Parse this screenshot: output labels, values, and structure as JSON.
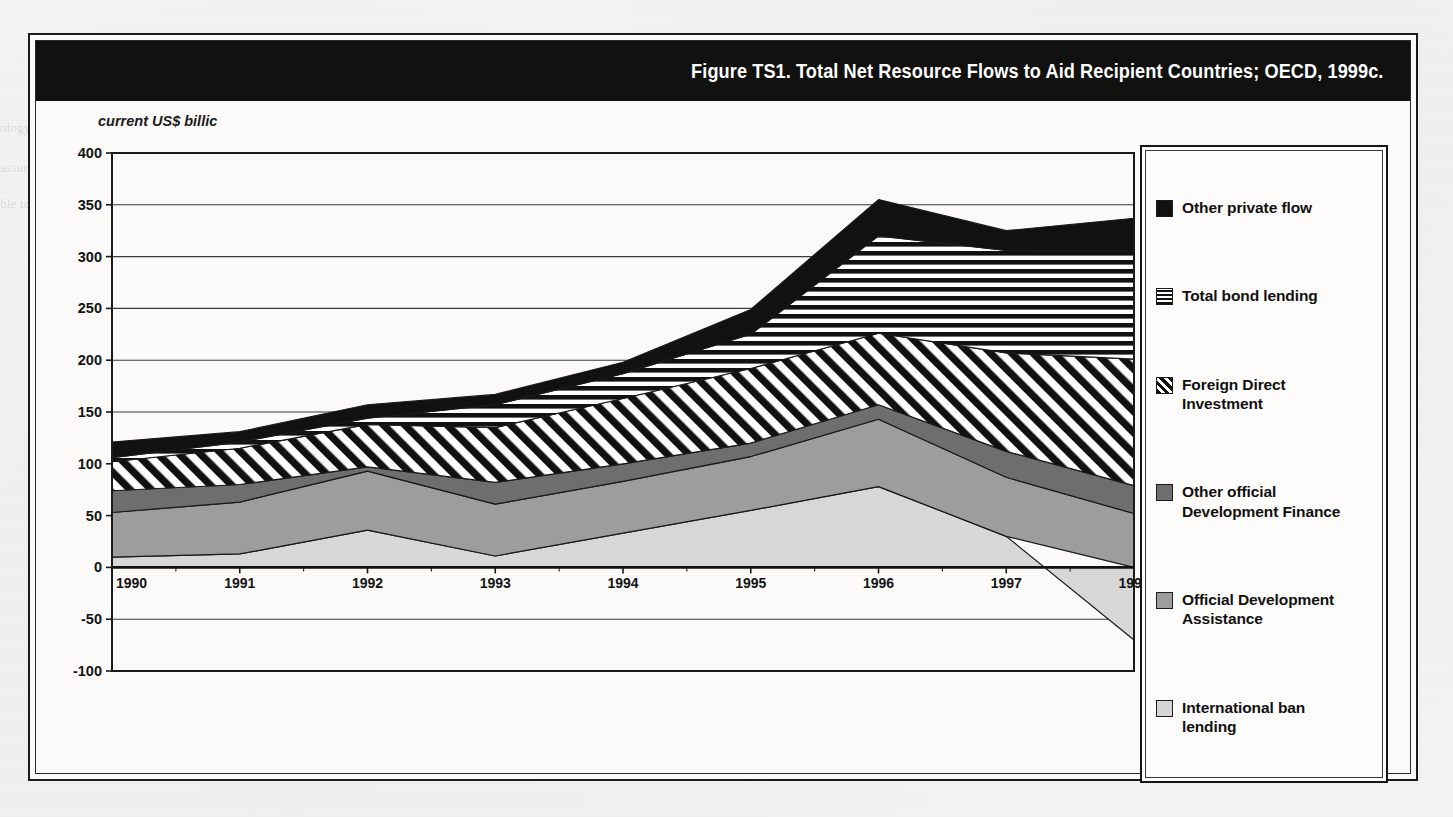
{
  "figure": {
    "title": "Figure TS1. Total Net Resource Flows to Aid Recipient Countries; OECD, 1999c.",
    "axis_caption": "current US$ billic"
  },
  "legend": {
    "position": "right",
    "items": [
      {
        "label": "Other private flow",
        "swatch": "sw-solid-black",
        "icon": "solid-black-swatch-icon"
      },
      {
        "label": "Total bond lending",
        "swatch": "sw-hstripe",
        "icon": "horizontal-stripe-swatch-icon"
      },
      {
        "label": "Foreign Direct Investment",
        "swatch": "sw-dstripe",
        "icon": "diagonal-stripe-swatch-icon"
      },
      {
        "label": "Other official Development Finance",
        "swatch": "sw-darkgray",
        "icon": "dark-gray-swatch-icon"
      },
      {
        "label": "Official Development Assistance",
        "swatch": "sw-midgray",
        "icon": "mid-gray-swatch-icon"
      },
      {
        "label": "International ban lending",
        "swatch": "sw-litegray",
        "icon": "light-gray-swatch-icon"
      }
    ]
  },
  "chart_data": {
    "type": "area",
    "stacked": true,
    "title": "Figure TS1. Total Net Resource Flows to Aid Recipient Countries; OECD, 1999c.",
    "xlabel": "",
    "ylabel": "current US$ billic",
    "x": [
      1990,
      1991,
      1992,
      1993,
      1994,
      1995,
      1996,
      1997,
      1998
    ],
    "xticks": [
      "1990",
      "1991",
      "1992",
      "1993",
      "1994",
      "1995",
      "1996",
      "1997",
      "1998"
    ],
    "yticks": [
      400,
      350,
      300,
      250,
      200,
      150,
      100,
      50,
      0,
      -50,
      -100
    ],
    "ylim": [
      -100,
      400
    ],
    "xlim": [
      1990,
      1998
    ],
    "grid": true,
    "legend_position": "right",
    "series": [
      {
        "name": "International ban lending",
        "swatch": "sw-litegray",
        "values": [
          10,
          13,
          36,
          11,
          33,
          55,
          78,
          30,
          -70
        ]
      },
      {
        "name": "Official Development Assistance",
        "swatch": "sw-midgray",
        "values": [
          43,
          50,
          57,
          50,
          50,
          52,
          65,
          57,
          52
        ]
      },
      {
        "name": "Other official Development Finance",
        "swatch": "sw-darkgray",
        "values": [
          21,
          17,
          4,
          21,
          17,
          13,
          14,
          25,
          27
        ]
      },
      {
        "name": "Foreign Direct Investment",
        "swatch": "sw-dstripe",
        "values": [
          28,
          35,
          41,
          53,
          63,
          72,
          69,
          95,
          122
        ]
      },
      {
        "name": "Total bond lending",
        "swatch": "sw-hstripe",
        "values": [
          4,
          6,
          6,
          22,
          24,
          33,
          94,
          99,
          104
        ]
      },
      {
        "name": "Other private flow",
        "swatch": "sw-solid-black",
        "values": [
          15,
          10,
          13,
          10,
          11,
          24,
          35,
          19,
          32
        ]
      }
    ],
    "totals": [
      121,
      131,
      157,
      167,
      198,
      249,
      355,
      325,
      267
    ],
    "annotations": []
  },
  "background_text": {
    "fragments": [
      "ology wise",
      "their entire environment, governing therein",
      "assume as the",
      "ble to businesses they have",
      "a",
      "n",
      "will",
      "Economic capital in",
      "country policy",
      "involve market",
      "effects on the"
    ]
  }
}
